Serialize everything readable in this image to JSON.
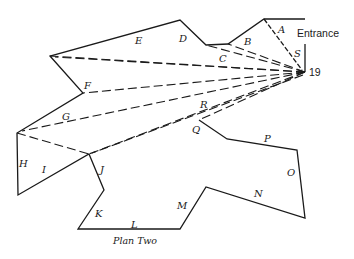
{
  "diagram": {
    "caption": "Plan Two",
    "entrance_label": "Entrance",
    "viewpoint_label": "19",
    "wall_labels": {
      "A": "A",
      "B": "B",
      "C": "C",
      "D": "D",
      "E": "E",
      "F": "F",
      "G": "G",
      "H": "H",
      "I": "I",
      "J": "J",
      "K": "K",
      "L": "L",
      "M": "M",
      "N": "N",
      "O": "O",
      "P": "P",
      "Q": "Q",
      "R": "R",
      "S": "S"
    },
    "colors": {
      "ink": "#1a1a1a",
      "background": "#ffffff"
    }
  }
}
